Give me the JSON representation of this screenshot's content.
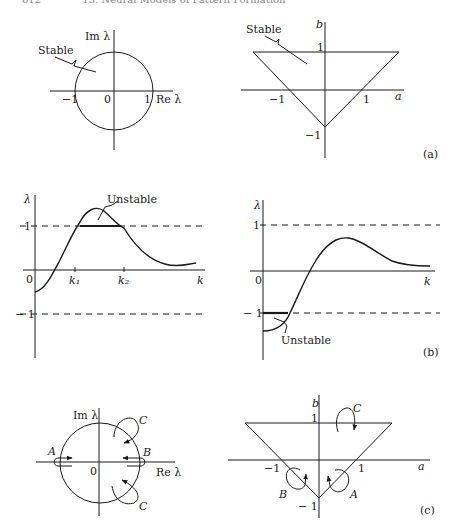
{
  "header": {
    "page_number": "612",
    "chapter_title": "13. Neural Models of Pattern Formation"
  },
  "figure": {
    "panel_a": {
      "label": "(a)",
      "left": {
        "x_axis_label": "Re λ",
        "y_axis_label": "Im λ",
        "ticks": [
          "−1",
          "0",
          "1"
        ],
        "region_label": "Stable"
      },
      "right": {
        "x_axis_label": "a",
        "y_axis_label": "b",
        "x_ticks": [
          "−1",
          "1"
        ],
        "y_ticks": [
          "1",
          "−1"
        ],
        "region_label": "Stable"
      }
    },
    "panel_b": {
      "label": "(b)",
      "left": {
        "x_axis_label": "k",
        "y_axis_label": "λ",
        "origin": "0",
        "y_ticks": [
          "1",
          "− 1"
        ],
        "x_ticks": [
          "k₁",
          "k₂"
        ],
        "region_label": "Unstable"
      },
      "right": {
        "x_axis_label": "k",
        "y_axis_label": "λ",
        "origin": "0",
        "y_ticks": [
          "1",
          "− 1"
        ],
        "region_label": "Unstable"
      }
    },
    "panel_c": {
      "label": "(c)",
      "left": {
        "x_axis_label": "Re λ",
        "y_axis_label": "Im λ",
        "origin": "0",
        "path_labels": [
          "A",
          "B",
          "C",
          "C"
        ]
      },
      "right": {
        "x_axis_label": "a",
        "y_axis_label": "b",
        "x_ticks": [
          "−1",
          "1"
        ],
        "y_ticks": [
          "1",
          "− 1"
        ],
        "path_labels": [
          "C",
          "B",
          "A"
        ]
      }
    }
  }
}
